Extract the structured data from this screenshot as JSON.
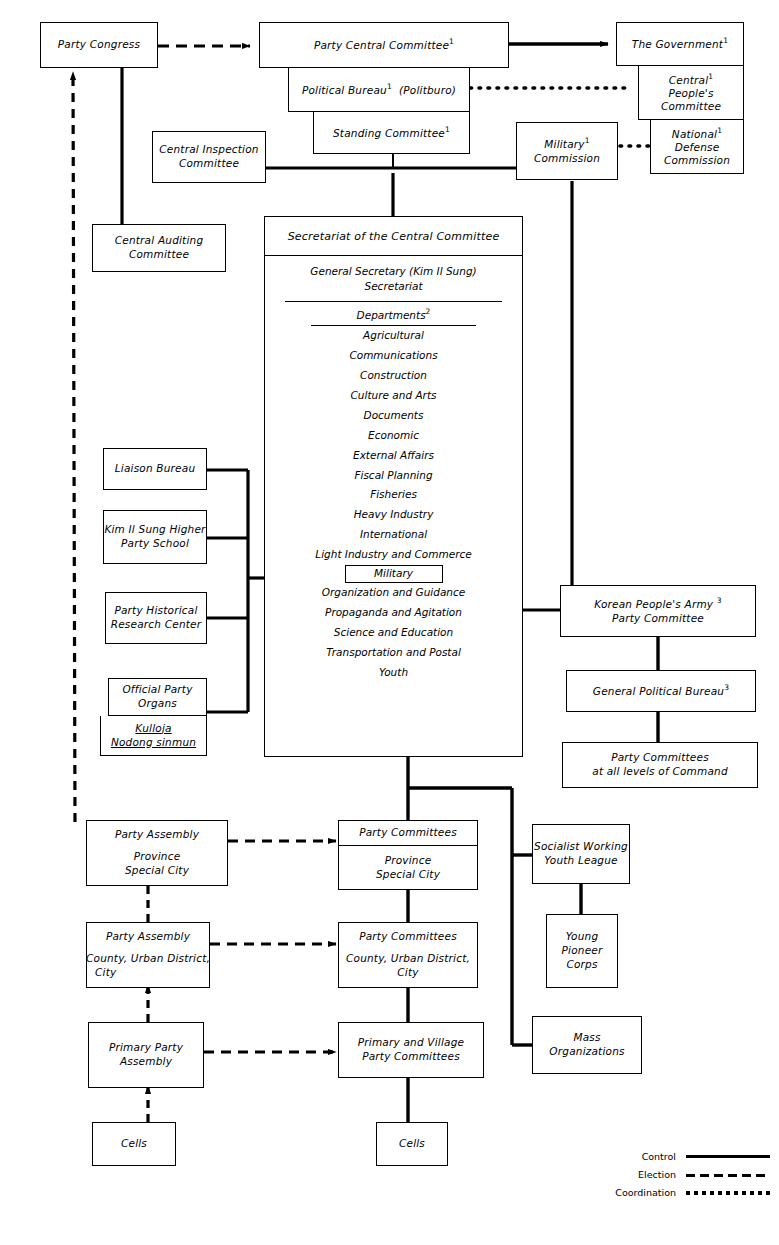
{
  "diagram": {
    "boxes": {
      "party_congress": "Party Congress",
      "party_central_committee": "Party Central Committee",
      "political_bureau": "Political Bureau",
      "politburo_paren": "(Politburo)",
      "standing_committee": "Standing Committee",
      "the_government": "The Government",
      "central_peoples_committee": [
        "Central",
        "People's",
        "Committee"
      ],
      "national_defense_commission": [
        "National",
        "Defense",
        "Commission"
      ],
      "military_commission": [
        "Military",
        "Commission"
      ],
      "central_inspection_committee": [
        "Central Inspection",
        "Committee"
      ],
      "central_auditing_committee": [
        "Central Auditing",
        "Committee"
      ],
      "liaison_bureau": "Liaison Bureau",
      "kim_il_sung_higher_party_school": [
        "Kim Il Sung Higher",
        "Party School"
      ],
      "party_historical_research_center": [
        "Party Historical",
        "Research Center"
      ],
      "official_party_organs": [
        "Official Party",
        "Organs"
      ],
      "official_party_organs_sub": [
        "Kulloja",
        "Nodong sinmun"
      ],
      "korean_peoples_army_party_committee": [
        "Korean People's Army",
        "Party Committee"
      ],
      "general_political_bureau": "General Political Bureau",
      "party_committees_all_levels": [
        "Party Committees",
        "at all levels of Command"
      ],
      "socialist_working_youth_league": [
        "Socialist Working",
        "Youth League"
      ],
      "young_pioneer_corps": [
        "Young",
        "Pioneer",
        "Corps"
      ],
      "mass_organizations": [
        "Mass",
        "Organizations"
      ],
      "party_assembly_province": [
        "Party Assembly",
        "Province",
        "Special City"
      ],
      "party_assembly_county": [
        "Party Assembly",
        "County, Urban District,",
        "City"
      ],
      "primary_party_assembly": [
        "Primary Party",
        "Assembly"
      ],
      "cells_left": "Cells",
      "party_committees_province_hdr": "Party Committees",
      "party_committees_province_body": [
        "Province",
        "Special City"
      ],
      "party_committees_county_hdr": "Party Committees",
      "party_committees_county_body": [
        "County, Urban District,",
        "City"
      ],
      "primary_village_party_committees": [
        "Primary and Village",
        "Party Committees"
      ],
      "cells_right": "Cells"
    },
    "secretariat": {
      "title": "Secretariat of the Central Committee",
      "general_secretary": "General Secretary (Kim Il Sung)",
      "secretariat_line": "Secretariat",
      "departments_header": "Departments",
      "departments_footnote": "2",
      "departments": [
        "Agricultural",
        "Communications",
        "Construction",
        "Culture and Arts",
        "Documents",
        "Economic",
        "External Affairs",
        "Fiscal Planning",
        "Fisheries",
        "Heavy Industry",
        "International",
        "Light Industry and Commerce",
        "Military",
        "Organization and Guidance",
        "Propaganda and Agitation",
        "Science and  Education",
        "Transportation and Postal",
        "Youth"
      ],
      "boxed_department": "Military"
    },
    "footnote_marks": {
      "one": "1",
      "two": "2",
      "three": "3"
    },
    "legend": {
      "items": [
        {
          "label": "Control",
          "style": "solid"
        },
        {
          "label": "Election",
          "style": "dashed"
        },
        {
          "label": "Coordination",
          "style": "dotted"
        }
      ]
    },
    "colors": {
      "line": "#000000",
      "background": "#ffffff"
    }
  }
}
